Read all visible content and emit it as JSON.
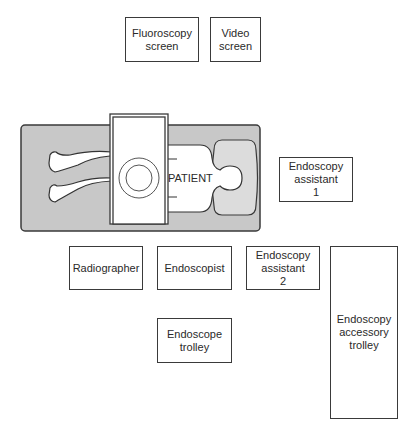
{
  "diagram": {
    "boxes": {
      "fluoroscopy_screen": "Fluoroscopy\nscreen",
      "video_screen": "Video\nscreen",
      "endoscopy_assistant_1": "Endoscopy\nassistant\n1",
      "radiographer": "Radiographer",
      "endoscopist": "Endoscopist",
      "endoscopy_assistant_2": "Endoscopy\nassistant\n2",
      "endoscope_trolley": "Endoscope\ntrolley",
      "endoscopy_accessory_trolley": "Endoscopy\naccessory\ntrolley"
    },
    "patient_label": "PATIENT",
    "colors": {
      "table_fill": "#c8c8c8",
      "pillow_fill": "#dcdcdc",
      "stroke": "#3a3a3a",
      "background": "#ffffff"
    }
  }
}
